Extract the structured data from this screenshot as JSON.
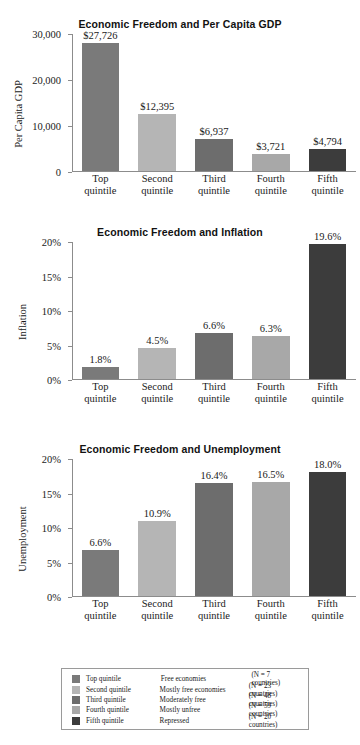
{
  "chart_data": [
    {
      "type": "bar",
      "title": "Economic Freedom and Per Capita GDP",
      "xlabel": "",
      "ylabel": "Per Capita GDP",
      "categories": [
        "Top quintile",
        "Second quintile",
        "Third quintile",
        "Fourth quintile",
        "Fifth quintile"
      ],
      "category_lines": [
        [
          "Top",
          "quintile"
        ],
        [
          "Second",
          "quintile"
        ],
        [
          "Third",
          "quintile"
        ],
        [
          "Fourth",
          "quintile"
        ],
        [
          "Fifth",
          "quintile"
        ]
      ],
      "values": [
        27726,
        12395,
        6937,
        3721,
        4794
      ],
      "value_labels": [
        "$27,726",
        "$12,395",
        "$6,937",
        "$3,721",
        "$4,794"
      ],
      "ylim": [
        0,
        30000
      ],
      "yticks": [
        0,
        10000,
        20000,
        30000
      ],
      "ytick_labels": [
        "0",
        "10,000",
        "20,000",
        "30,000"
      ],
      "grid": false,
      "legend_position": "bottom"
    },
    {
      "type": "bar",
      "title": "Economic Freedom and Inflation",
      "xlabel": "",
      "ylabel": "Inflation",
      "categories": [
        "Top quintile",
        "Second quintile",
        "Third quintile",
        "Fourth quintile",
        "Fifth quintile"
      ],
      "category_lines": [
        [
          "Top",
          "quintile"
        ],
        [
          "Second",
          "quintile"
        ],
        [
          "Third",
          "quintile"
        ],
        [
          "Fourth",
          "quintile"
        ],
        [
          "Fifth",
          "quintile"
        ]
      ],
      "values": [
        1.8,
        4.5,
        6.6,
        6.3,
        19.6
      ],
      "value_labels": [
        "1.8%",
        "4.5%",
        "6.6%",
        "6.3%",
        "19.6%"
      ],
      "ylim": [
        0,
        20
      ],
      "yticks": [
        0,
        5,
        10,
        15,
        20
      ],
      "ytick_labels": [
        "0%",
        "5%",
        "10%",
        "15%",
        "20%"
      ],
      "grid": false,
      "legend_position": "bottom"
    },
    {
      "type": "bar",
      "title": "Economic Freedom and Unemployment",
      "xlabel": "",
      "ylabel": "Unemployment",
      "categories": [
        "Top quintile",
        "Second quintile",
        "Third quintile",
        "Fourth quintile",
        "Fifth quintile"
      ],
      "category_lines": [
        [
          "Top",
          "quintile"
        ],
        [
          "Second",
          "quintile"
        ],
        [
          "Third",
          "quintile"
        ],
        [
          "Fourth",
          "quintile"
        ],
        [
          "Fifth",
          "quintile"
        ]
      ],
      "values": [
        6.6,
        10.9,
        16.4,
        16.5,
        18.0
      ],
      "value_labels": [
        "6.6%",
        "10.9%",
        "16.4%",
        "16.5%",
        "18.0%"
      ],
      "ylim": [
        0,
        20
      ],
      "yticks": [
        0,
        5,
        10,
        15,
        20
      ],
      "ytick_labels": [
        "0%",
        "5%",
        "10%",
        "15%",
        "20%"
      ],
      "grid": false,
      "legend_position": "bottom"
    }
  ],
  "series_colors": [
    "#7a7a7a",
    "#b5b5b5",
    "#6d6d6d",
    "#a8a8a8",
    "#3c3c3c"
  ],
  "legend": {
    "rows": [
      {
        "quintile": "Top quintile",
        "description": "Free economies",
        "n": "(N = 7 countries)",
        "color": "#7a7a7a"
      },
      {
        "quintile": "Second quintile",
        "description": "Mostly free economies",
        "n": "(N = 23 countries)",
        "color": "#b5b5b5"
      },
      {
        "quintile": "Third quintile",
        "description": "Moderately free",
        "n": "(N = 48 countries)",
        "color": "#6d6d6d"
      },
      {
        "quintile": "Fourth quintile",
        "description": "Mostly unfree",
        "n": "(N = 59 countries)",
        "color": "#a8a8a8"
      },
      {
        "quintile": "Fifth quintile",
        "description": "Repressed",
        "n": "(N = 20 countries)",
        "color": "#3c3c3c"
      }
    ]
  }
}
